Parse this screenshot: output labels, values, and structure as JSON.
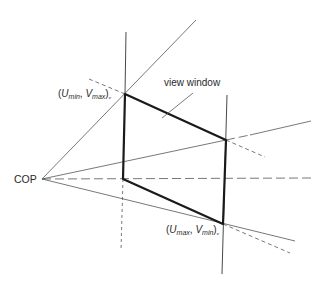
{
  "labels": {
    "cop": "COP",
    "view_window": "view window",
    "top_left_corner": {
      "open": "(",
      "u": "U",
      "u_sub": "min",
      "sep": ", ",
      "v": "V",
      "v_sub": "max",
      "close": ")",
      "tail": "ᵥ"
    },
    "bottom_right_corner": {
      "open": "(",
      "u": "U",
      "u_sub": "max",
      "sep": ", ",
      "v": "V",
      "v_sub": "min",
      "close": ")",
      "tail": "ᵥ"
    }
  },
  "geometry": {
    "cop": [
      42,
      179
    ],
    "window": {
      "top_left": [
        125,
        94
      ],
      "top_right": [
        226,
        140
      ],
      "bottom_right": [
        223,
        224
      ],
      "bottom_left": [
        123,
        179
      ]
    }
  },
  "colors": {
    "thin_line": "#555555",
    "window_edge": "#1a1a1a",
    "text": "#2a2a2a",
    "background": "#ffffff"
  }
}
